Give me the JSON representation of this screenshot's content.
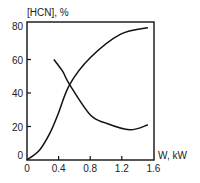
{
  "chart_data": {
    "type": "line",
    "title": "",
    "xlabel": "W, kW",
    "ylabel": "[HCN], %",
    "xlim": [
      0,
      1.6
    ],
    "ylim": [
      0,
      80
    ],
    "xticks": [
      0,
      0.4,
      0.8,
      1.2,
      1.6
    ],
    "xtick_labels": [
      "0",
      "0.4",
      "0.8",
      "1.2",
      "1.6"
    ],
    "yticks": [
      0,
      20,
      40,
      60,
      80
    ],
    "ytick_labels": [
      "0",
      "20",
      "40",
      "60",
      "80"
    ],
    "grid": false,
    "legend": null,
    "series": [
      {
        "name": "rising curve",
        "x": [
          0,
          0.16,
          0.29,
          0.39,
          0.54,
          0.8,
          1.18,
          1.53
        ],
        "y": [
          0,
          6,
          16,
          27,
          45,
          61,
          75,
          79
        ]
      },
      {
        "name": "falling curve",
        "x": [
          0.34,
          0.45,
          0.54,
          0.8,
          1.0,
          1.3,
          1.53
        ],
        "y": [
          60,
          53,
          45,
          27,
          22,
          18,
          21
        ]
      }
    ]
  }
}
